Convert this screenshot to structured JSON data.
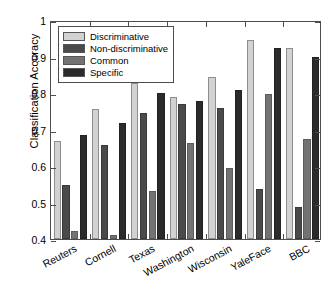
{
  "chart_data": {
    "type": "bar",
    "title": "",
    "xlabel": "",
    "ylabel": "Classification Accuracy",
    "ylim": [
      0.4,
      1
    ],
    "yticks": [
      "0.4",
      "0.5",
      "0.6",
      "0.7",
      "0.8",
      "0.9",
      "1"
    ],
    "ytick_values": [
      0.4,
      0.5,
      0.6,
      0.7,
      0.8,
      0.9,
      1.0
    ],
    "grid": false,
    "legend_position": "upper left",
    "categories": [
      "Reuters",
      "Cornell",
      "Texas",
      "Washington",
      "Wisconsin",
      "YaleFace",
      "BBC"
    ],
    "series": [
      {
        "name": "Discriminative",
        "color": "#d2d2d2",
        "values": [
          0.668,
          0.756,
          0.828,
          0.788,
          0.843,
          0.945,
          0.922
        ]
      },
      {
        "name": "Non-discriminative",
        "color": "#4a4a4a",
        "values": [
          0.548,
          0.657,
          0.745,
          0.771,
          0.758,
          0.537,
          0.488
        ]
      },
      {
        "name": "Common",
        "color": "#737373",
        "values": [
          0.422,
          0.41,
          0.531,
          0.662,
          0.595,
          0.798,
          0.674
        ]
      },
      {
        "name": "Specific",
        "color": "#2b2b2b",
        "values": [
          0.684,
          0.718,
          0.8,
          0.779,
          0.808,
          0.923,
          0.9
        ]
      }
    ]
  }
}
